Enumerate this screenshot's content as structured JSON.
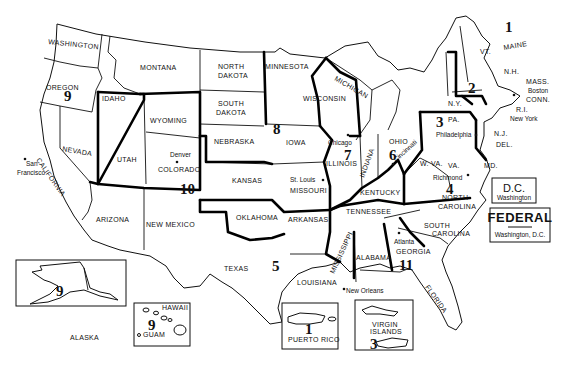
{
  "map": {
    "title": "Federal Regions of the United States",
    "states": {
      "washington": "WASHINGTON",
      "oregon": "OREGON",
      "idaho": "IDAHO",
      "montana": "MONTANA",
      "wyoming": "WYOMING",
      "california": "CALIFORNIA",
      "nevada": "NEVADA",
      "utah": "UTAH",
      "colorado": "COLORADO",
      "arizona": "ARIZONA",
      "new_mexico": "NEW MEXICO",
      "north_dakota": "NORTH DAKOTA",
      "south_dakota": "SOUTH DAKOTA",
      "nebraska": "NEBRASKA",
      "kansas": "KANSAS",
      "oklahoma": "OKLAHOMA",
      "texas": "TEXAS",
      "minnesota": "MINNESOTA",
      "iowa": "IOWA",
      "missouri": "MISSOURI",
      "arkansas": "ARKANSAS",
      "louisiana": "LOUISIANA",
      "wisconsin": "WISCONSIN",
      "michigan": "MICHIGAN",
      "illinois": "ILLINOIS",
      "indiana": "INDIANA",
      "ohio": "OHIO",
      "kentucky": "KENTUCKY",
      "tennessee": "TENNESSEE",
      "mississippi": "MISSISSIPPI",
      "alabama": "ALABAMA",
      "georgia": "GEORGIA",
      "florida": "FLORIDA",
      "south_carolina": "SOUTH CAROLINA",
      "north_carolina": "NORTH CAROLINA",
      "virginia": "VA.",
      "west_virginia": "W. VA.",
      "maryland": "MD.",
      "delaware": "DEL.",
      "new_jersey": "N.J.",
      "pennsylvania": "PA.",
      "new_york": "N.Y.",
      "vermont": "VT.",
      "new_hampshire": "N.H.",
      "maine": "MAINE",
      "massachusetts": "MASS.",
      "rhode_island": "R.I.",
      "connecticut": "CONN.",
      "alaska": "ALASKA",
      "hawaii": "HAWAII",
      "guam": "GUAM",
      "puerto_rico": "PUERTO RICO",
      "virgin_islands_1": "VIRGIN",
      "virgin_islands_2": "ISLANDS"
    },
    "cities": {
      "san_francisco_1": "San",
      "san_francisco_2": "Francisco",
      "denver": "Denver",
      "chicago": "Chicago",
      "st_louis": "St. Louis",
      "cincinnati": "Cincinnati",
      "philadelphia": "Philadelphia",
      "richmond": "Richmond",
      "atlanta": "Atlanta",
      "new_orleans": "New Orleans",
      "new_york": "New York",
      "boston": "Boston"
    },
    "regions": {
      "r1": "1",
      "r2": "2",
      "r3": "3",
      "r4": "4",
      "r5": "5",
      "r6": "6",
      "r7": "7",
      "r8": "8",
      "r9": "9",
      "r10": "10",
      "r11": "11",
      "r9_alaska": "9",
      "r9_hawaii": "9",
      "r1_pr": "1",
      "r3_vi": "3"
    },
    "dc_box": {
      "title": "D.C.",
      "subtitle": "Washington"
    },
    "federal_box": {
      "title": "FEDERAL",
      "subtitle": "Washington, D.C."
    }
  }
}
